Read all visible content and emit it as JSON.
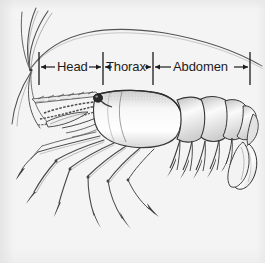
{
  "figure": {
    "background_color": "#f4f4f4",
    "ink_color": "#1c1c1c",
    "labels": [
      {
        "id": "head",
        "text": "Head",
        "x": 70,
        "y": 67
      },
      {
        "id": "thorax",
        "text": "Thorax",
        "x": 128,
        "y": 67
      },
      {
        "id": "abdomen",
        "text": "Abdomen",
        "x": 202,
        "y": 67
      }
    ],
    "dimension_line": {
      "y": 67,
      "tick_color": "#1c1c1c",
      "ticks_x": [
        39,
        103,
        153,
        250
      ],
      "tick_top": 52,
      "tick_bottom": 85
    },
    "anatomy_parts": [
      "antennae",
      "antennules",
      "rostrum",
      "eye",
      "carapace",
      "pereiopods",
      "pleopods",
      "abdominal-segments",
      "uropods",
      "telson"
    ]
  }
}
